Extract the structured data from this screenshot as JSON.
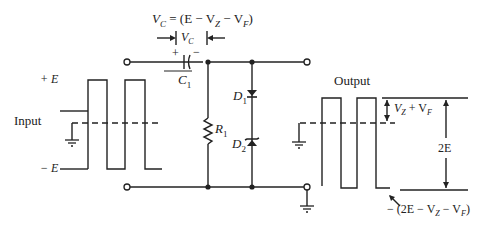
{
  "diagram": {
    "type": "zener clamper circuit",
    "equation_vc": "V_C = (E − V_Z − V_F)",
    "labels": {
      "vc_top": "V",
      "vc_top_sub": "C",
      "vc_eq_rest": " = (E − V",
      "vc_eq_z": "Z",
      "vc_eq_mid": " − V",
      "vc_eq_f": "F",
      "vc_eq_end": ")",
      "vc_dim": "V",
      "vc_dim_sub": "C",
      "cap_plus": "+",
      "cap_minus": "−",
      "capacitor": "C",
      "capacitor_sub": "1",
      "resistor": "R",
      "resistor_sub": "1",
      "diode1": "D",
      "diode1_sub": "1",
      "diode2": "D",
      "diode2_sub": "2",
      "input_title": "Input",
      "input_pos": "+ E",
      "input_neg": "− E",
      "output_title": "Output",
      "out_shift": "V",
      "out_shift_z": "Z",
      "out_shift_mid": " + V",
      "out_shift_f": "F",
      "out_pp": "2E",
      "out_low": "− (2E − V",
      "out_low_z": "Z",
      "out_low_mid": " − V",
      "out_low_f": "F",
      "out_low_end": ")"
    },
    "components": [
      {
        "id": "C1",
        "kind": "capacitor",
        "position": "series top"
      },
      {
        "id": "R1",
        "kind": "resistor",
        "position": "shunt"
      },
      {
        "id": "D1",
        "kind": "diode",
        "position": "shunt, series with D2"
      },
      {
        "id": "D2",
        "kind": "zener diode",
        "position": "shunt, series with D1"
      }
    ],
    "colors": {
      "line": "#222222",
      "background": "#ffffff"
    }
  }
}
